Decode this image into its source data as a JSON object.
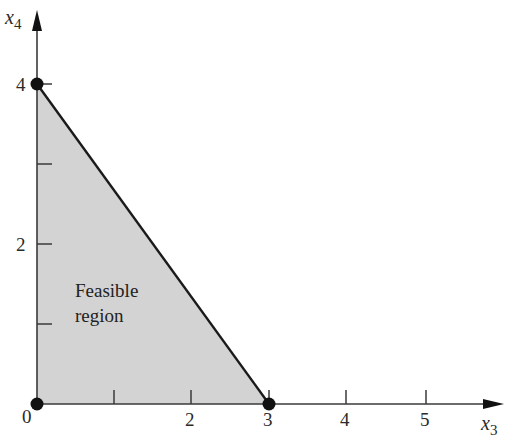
{
  "diagram": {
    "title": "",
    "x_axis": {
      "name": "x",
      "subscript": "3",
      "ticks": [
        {
          "value": 1,
          "label": ""
        },
        {
          "value": 2,
          "label": "2"
        },
        {
          "value": 3,
          "label": "3"
        },
        {
          "value": 4,
          "label": "4"
        },
        {
          "value": 5,
          "label": "5"
        }
      ],
      "origin_label": "0"
    },
    "y_axis": {
      "name": "x",
      "subscript": "4",
      "ticks": [
        {
          "value": 1,
          "label": ""
        },
        {
          "value": 2,
          "label": "2"
        },
        {
          "value": 3,
          "label": ""
        },
        {
          "value": 4,
          "label": "4"
        }
      ]
    },
    "region": {
      "label_line1": "Feasible",
      "label_line2": "region",
      "vertices": [
        [
          0,
          0
        ],
        [
          0,
          4
        ],
        [
          3,
          0
        ]
      ],
      "fill_color": "#d3d3d3"
    },
    "corner_points": [
      {
        "x3": 0,
        "x4": 0
      },
      {
        "x3": 0,
        "x4": 4
      },
      {
        "x3": 3,
        "x4": 0
      }
    ],
    "colors": {
      "axis": "#3a3a3a",
      "boundary": "#1a1a1a",
      "point": "#111111"
    }
  }
}
